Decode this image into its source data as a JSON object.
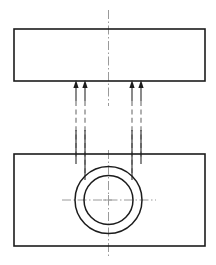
{
  "drawing": {
    "title": "Piston Pin Bore Projection Drawing",
    "type": "orthographic-projection",
    "canvas": {
      "width": 216,
      "height": 265,
      "background": "#ffffff"
    },
    "colors": {
      "outline": "#1c1c1c",
      "bore": "#1c1c1c",
      "centerline": "#9a9a9a",
      "hidden_line": "#6e6e6e",
      "leader": "#333333",
      "arrowhead": "#1c1c1c"
    },
    "views": [
      {
        "name": "top-view",
        "label": "Top View",
        "shape": "rectangle",
        "x": 14,
        "y": 29,
        "width": 191,
        "height": 52
      },
      {
        "name": "front-view",
        "label": "Front View",
        "shape": "rectangle",
        "x": 14,
        "y": 154,
        "width": 191,
        "height": 92
      }
    ],
    "bore": {
      "label": "Pin Bore",
      "center_x": 108.5,
      "center_y": 200,
      "outer_radius": 33.5,
      "inner_radius": 24.5
    },
    "centerlines": [
      {
        "name": "vertical-centerline-top",
        "orientation": "vertical",
        "x": 108.5,
        "y1": 10,
        "y2": 106
      },
      {
        "name": "vertical-centerline-bottom",
        "orientation": "vertical",
        "x": 108.5,
        "y1": 150,
        "y2": 256
      },
      {
        "name": "horizontal-centerline-bore",
        "orientation": "horizontal",
        "y": 200,
        "x1": 62,
        "x2": 156
      }
    ],
    "projection_lines": [
      {
        "name": "projection-line-1",
        "x": 76,
        "arrow_tip_y": 82,
        "solid_to_y": 101,
        "dashed_to_y": 157
      },
      {
        "name": "projection-line-2",
        "x": 85,
        "arrow_tip_y": 82,
        "solid_to_y": 101,
        "dashed_to_y": 173
      },
      {
        "name": "projection-line-3",
        "x": 132,
        "arrow_tip_y": 82,
        "solid_to_y": 101,
        "dashed_to_y": 173
      },
      {
        "name": "projection-line-4",
        "x": 141,
        "arrow_tip_y": 82,
        "solid_to_y": 101,
        "dashed_to_y": 157
      }
    ],
    "arrow_count": 4,
    "arrow_direction": "up"
  }
}
